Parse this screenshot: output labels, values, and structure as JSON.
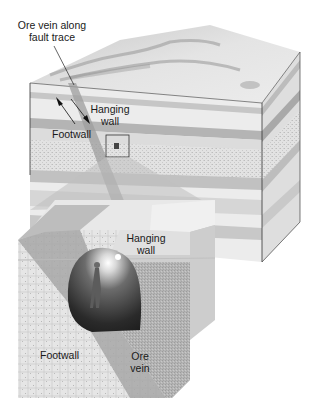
{
  "diagram": {
    "type": "geologic block diagram",
    "labels": {
      "ore_vein_line1": "Ore vein along",
      "ore_vein_line2": "fault trace",
      "hanging_wall_top_1": "Hanging",
      "hanging_wall_top_2": "wall",
      "footwall_top": "Footwall",
      "hanging_wall_inset_1": "Hanging",
      "hanging_wall_inset_2": "wall",
      "footwall_inset": "Footwall",
      "ore_vein_inset_1": "Ore",
      "ore_vein_inset_2": "vein"
    },
    "colors": {
      "background": "#ffffff",
      "surface": "#e4e4e4",
      "layer_light": "#ececec",
      "layer_mid": "#c8c8c8",
      "layer_dark": "#a9a9a9",
      "fault_zone": "#9a9a9a",
      "tunnel": "#3a3a3a",
      "outline": "#333333"
    }
  }
}
